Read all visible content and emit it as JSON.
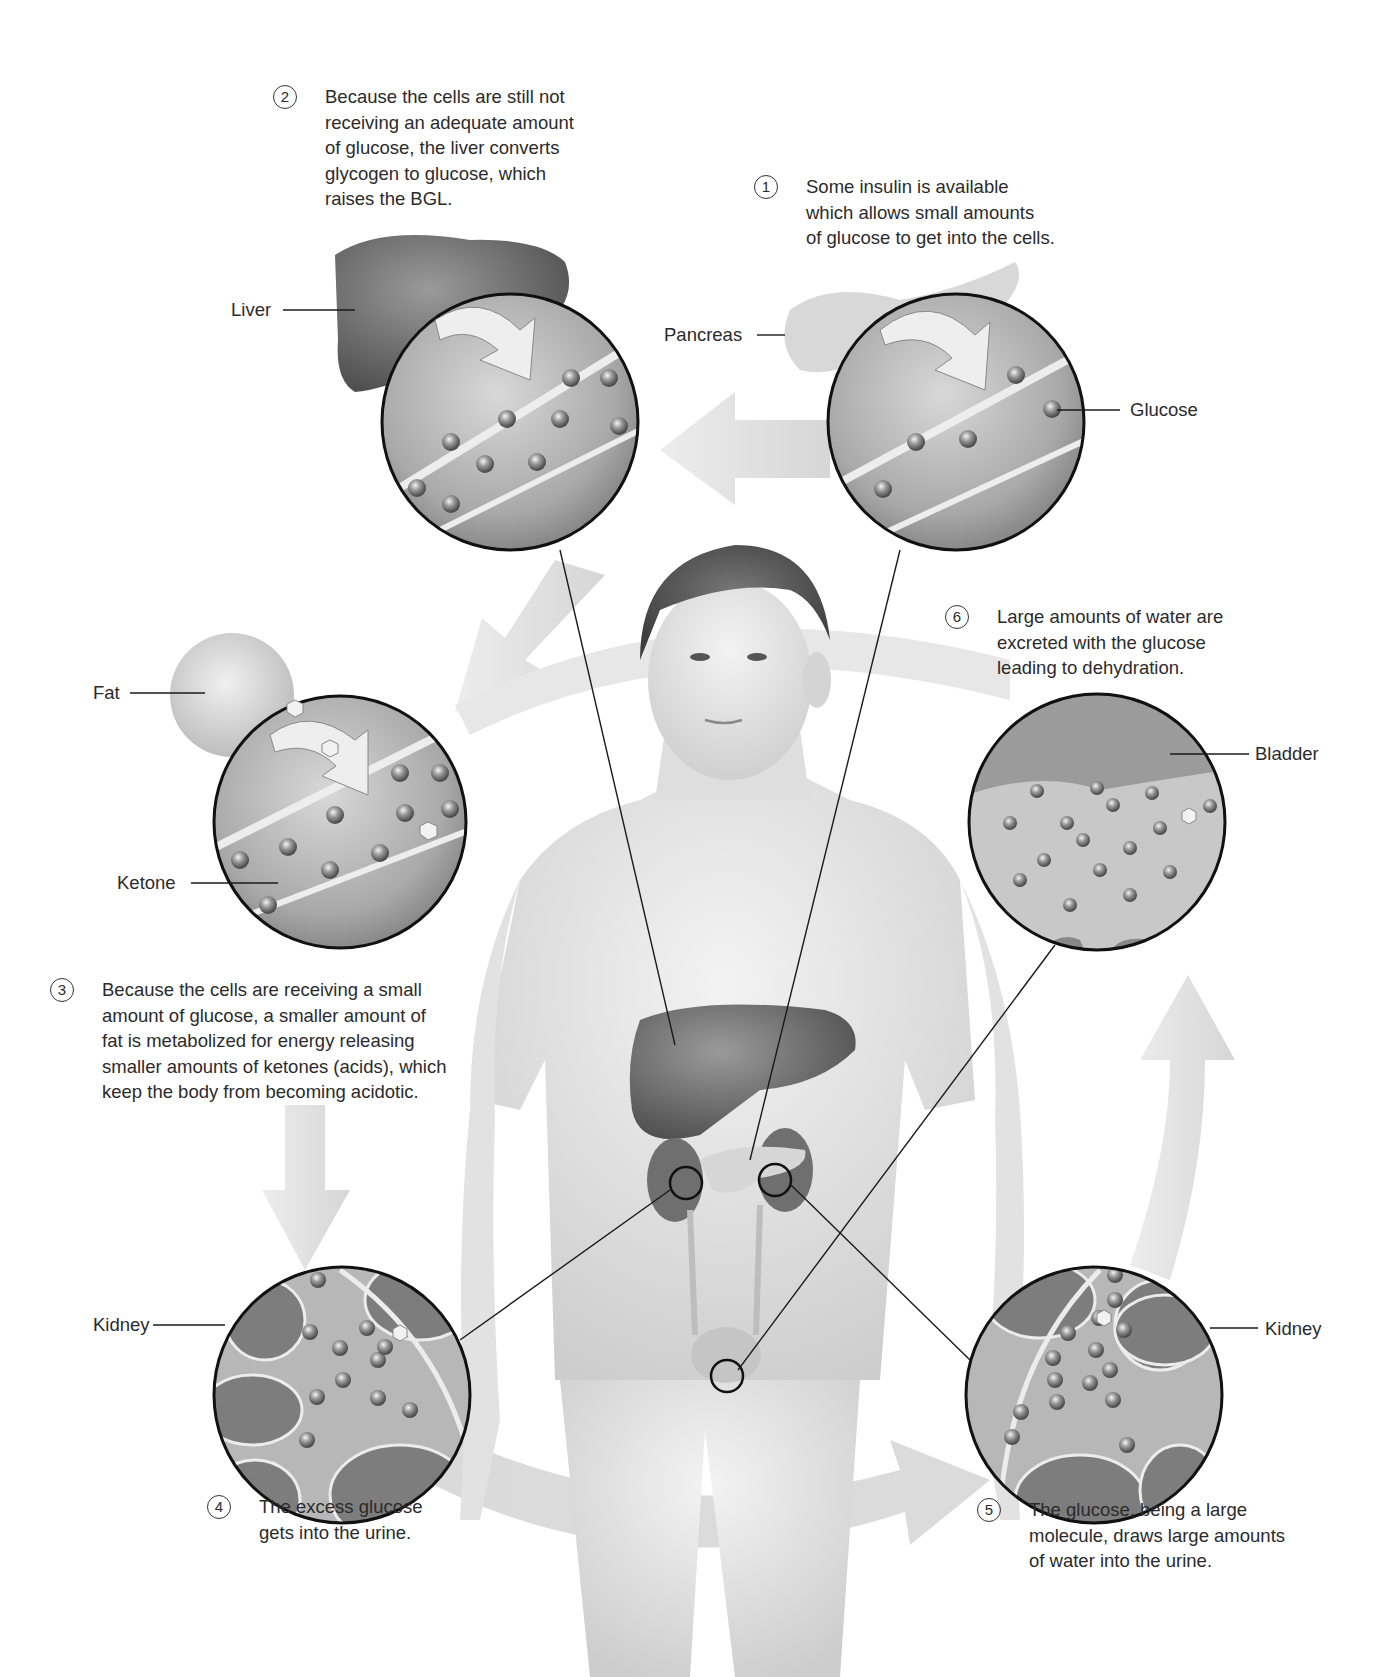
{
  "figure": {
    "theme_colors": {
      "background": "#ffffff",
      "text": "#2b2b2b",
      "flow_arrow": "#e2e2e2",
      "lens_border": "#111111",
      "tissue_dark": "#7a7a7a",
      "tissue_light": "#cfcfcf"
    },
    "steps": [
      {
        "number": "1",
        "text": "Some insulin is available\nwhich allows small amounts\nof glucose to get into the cells."
      },
      {
        "number": "2",
        "text": "Because the cells are still not\nreceiving an adequate amount\nof glucose, the liver converts\nglycogen to glucose, which\nraises the BGL."
      },
      {
        "number": "3",
        "text": "Because the cells are receiving a small\namount of glucose, a smaller amount of\nfat is metabolized for energy releasing\nsmaller amounts of ketones (acids), which\nkeep the body from becoming acidotic."
      },
      {
        "number": "4",
        "text": "The excess glucose\ngets into the urine."
      },
      {
        "number": "5",
        "text": "The glucose, being a large\nmolecule, draws large amounts\nof water into the urine."
      },
      {
        "number": "6",
        "text": "Large amounts of water are\nexcreted with the glucose\nleading to dehydration."
      }
    ],
    "labels": {
      "liver": "Liver",
      "pancreas": "Pancreas",
      "glucose": "Glucose",
      "fat": "Fat",
      "ketone": "Ketone",
      "bladder": "Bladder",
      "kidney_left": "Kidney",
      "kidney_right": "Kidney"
    },
    "magnified_views": [
      {
        "id": "liver-view",
        "organ": "Liver"
      },
      {
        "id": "pancreas-view",
        "organ": "Pancreas"
      },
      {
        "id": "fat-view",
        "organ": "Fat"
      },
      {
        "id": "bladder-view",
        "organ": "Bladder"
      },
      {
        "id": "kidney-left-view",
        "organ": "Kidney"
      },
      {
        "id": "kidney-right-view",
        "organ": "Kidney"
      }
    ]
  }
}
